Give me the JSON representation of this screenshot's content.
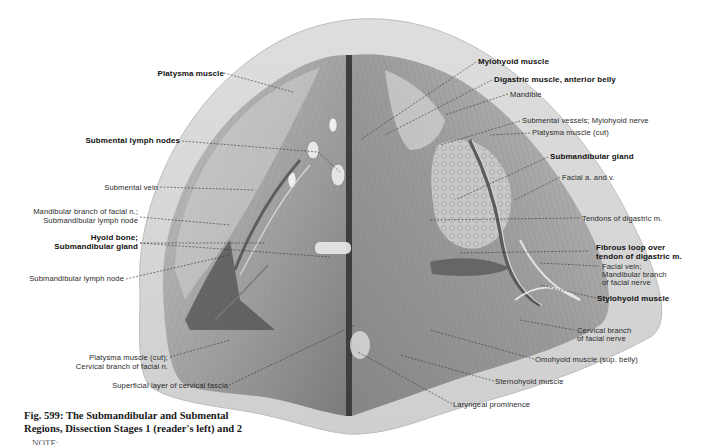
{
  "figure": {
    "number": "Fig. 599",
    "caption_line1": "Fig. 599:  The Submandibular and Submental",
    "caption_line2": "Regions, Dissection Stages 1 (reader's left) and 2",
    "note_truncated": "NOTE:",
    "colors": {
      "background": "#ffffff",
      "skin_border": "#d9d9d9",
      "skin_inner": "#c8c8c8",
      "tissue_mid": "#a8a8a8",
      "tissue_dark": "#6e6e6e",
      "leader_line": "#333333"
    }
  },
  "labels": {
    "left": [
      {
        "id": "platysma-muscle",
        "text": "Platysma muscle",
        "bold": true
      },
      {
        "id": "submental-lymph-nodes",
        "text": "Submental lymph nodes",
        "bold": true
      },
      {
        "id": "submental-vein",
        "text": "Submental vein",
        "bold": false
      },
      {
        "id": "mandibular-branch-line1",
        "text": "Mandibular branch of facial n.;",
        "bold": false
      },
      {
        "id": "mandibular-branch-line2",
        "text": "Submandibular lymph node",
        "bold": false
      },
      {
        "id": "hyoid-line1",
        "text": "Hyoid bone;",
        "bold": true
      },
      {
        "id": "hyoid-line2",
        "text": "Submandibular gland",
        "bold": true
      },
      {
        "id": "submandibular-lymph-node",
        "text": "Submandibular lymph node",
        "bold": false
      },
      {
        "id": "platysma-cut-line1",
        "text": "Platysma muscle (cut);",
        "bold": false
      },
      {
        "id": "platysma-cut-line2",
        "text": "Cervical branch of facial n.",
        "bold": false
      },
      {
        "id": "superficial-fascia",
        "text": "Superficial layer of cervical fascia",
        "bold": false
      }
    ],
    "right": [
      {
        "id": "mylohyoid-muscle",
        "text": "Mylohyoid muscle",
        "bold": true
      },
      {
        "id": "digastric-anterior",
        "text": "Digastric muscle, anterior belly",
        "bold": true
      },
      {
        "id": "mandible",
        "text": "Mandible",
        "bold": false
      },
      {
        "id": "submental-vessels",
        "text": "Submental vessels; Mylohyoid nerve",
        "bold": false
      },
      {
        "id": "platysma-cut-right",
        "text": "Platysma muscle (cut)",
        "bold": false
      },
      {
        "id": "submandibular-gland",
        "text": "Submandibular gland",
        "bold": true
      },
      {
        "id": "facial-a-v",
        "text": "Facial a. and v.",
        "bold": false
      },
      {
        "id": "tendons-digastric",
        "text": "Tendons of digastric m.",
        "bold": false
      },
      {
        "id": "fibrous-loop-line1",
        "text": "Fibrous loop over",
        "bold": true
      },
      {
        "id": "fibrous-loop-line2",
        "text": "tendon of digastric m.",
        "bold": true
      },
      {
        "id": "facial-vein-line1",
        "text": "Facial vein;",
        "bold": false
      },
      {
        "id": "facial-vein-line2",
        "text": "Mandibular branch",
        "bold": false
      },
      {
        "id": "facial-vein-line3",
        "text": "of facial nerve",
        "bold": false
      },
      {
        "id": "stylohyoid-muscle",
        "text": "Stylohyoid muscle",
        "bold": true
      },
      {
        "id": "cervical-branch-line1",
        "text": "Cervical branch",
        "bold": false
      },
      {
        "id": "cervical-branch-line2",
        "text": "of facial nerve",
        "bold": false
      },
      {
        "id": "omohyoid-muscle",
        "text": "Omohyoid muscle (sup. belly)",
        "bold": false
      },
      {
        "id": "sternohyoid-muscle",
        "text": "Sternohyoid muscle",
        "bold": false
      },
      {
        "id": "laryngeal-prominence",
        "text": "Laryngeal prominence",
        "bold": false
      }
    ]
  }
}
